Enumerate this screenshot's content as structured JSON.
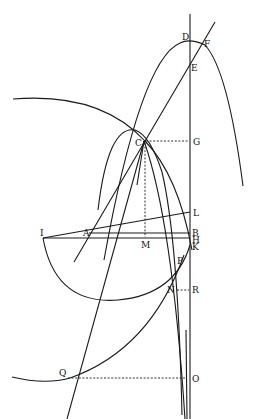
{
  "figure": {
    "type": "geometric construction diagram",
    "labels": {
      "D": "D",
      "F": "F",
      "E": "E",
      "G": "G",
      "C": "C",
      "L": "L",
      "I": "I",
      "A": "A",
      "B": "B",
      "H": "H",
      "M": "M",
      "K": "K",
      "P": "P",
      "N": "N",
      "R": "R",
      "Q": "Q",
      "O": "O"
    },
    "points": {
      "D": [
        190,
        41
      ],
      "F": [
        200,
        45
      ],
      "E": [
        190,
        63
      ],
      "G": [
        190,
        141
      ],
      "C": [
        144,
        141
      ],
      "L": [
        190,
        212
      ],
      "I": [
        43,
        238
      ],
      "A": [
        89,
        232
      ],
      "B": [
        190,
        233
      ],
      "H": [
        190,
        238
      ],
      "M": [
        145,
        238
      ],
      "K": [
        190,
        246
      ],
      "P": [
        182,
        260
      ],
      "N": [
        175,
        289
      ],
      "R": [
        190,
        289
      ],
      "Q": [
        67,
        378
      ],
      "O": [
        186,
        378
      ]
    }
  }
}
